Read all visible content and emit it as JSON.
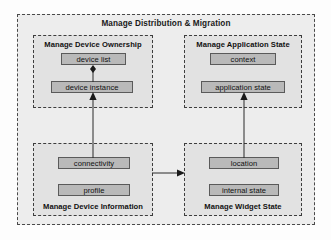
{
  "diagram": {
    "title": "Manage Distribution & Migration",
    "groups": [
      {
        "id": "ownership",
        "label": "Manage Device Ownership",
        "label_position": "top",
        "items": [
          {
            "id": "device-list",
            "label": "device list"
          },
          {
            "id": "device-instance",
            "label": "device instance"
          }
        ]
      },
      {
        "id": "appstate",
        "label": "Manage Application State",
        "label_position": "top",
        "items": [
          {
            "id": "context",
            "label": "context"
          },
          {
            "id": "application-state",
            "label": "application state"
          }
        ]
      },
      {
        "id": "deviceinfo",
        "label": "Manage Device Information",
        "label_position": "bottom",
        "items": [
          {
            "id": "connectivity",
            "label": "connectivity"
          },
          {
            "id": "profile",
            "label": "profile"
          }
        ]
      },
      {
        "id": "widgetstate",
        "label": "Manage Widget State",
        "label_position": "bottom",
        "items": [
          {
            "id": "location",
            "label": "location"
          },
          {
            "id": "internal-state",
            "label": "internal state"
          }
        ]
      }
    ],
    "connectors": [
      {
        "id": "device-instance-to-device-list",
        "from": "device instance",
        "to": "device list",
        "direction": "up",
        "marker": "diamond-arrow"
      },
      {
        "id": "device-information-to-device-instance",
        "from": "Manage Device Information",
        "to": "device instance",
        "direction": "up",
        "marker": "arrow"
      },
      {
        "id": "widget-state-to-application-state",
        "from": "Manage Widget State",
        "to": "application state",
        "direction": "up",
        "marker": "arrow"
      },
      {
        "id": "device-information-to-widget-state",
        "from": "Manage Device Information",
        "to": "Manage Widget State",
        "direction": "right",
        "marker": "arrow"
      }
    ]
  },
  "colors": {
    "outer_fill": "#ededed",
    "group_fill": "#e2e2e2",
    "item_fill": "#b9b9b9",
    "line": "#3d3d3d",
    "text": "#101010"
  }
}
